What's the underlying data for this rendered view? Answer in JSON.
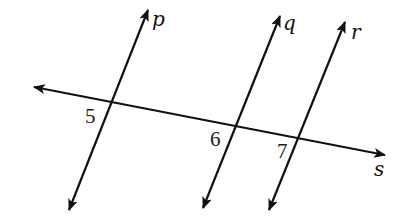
{
  "diagram": {
    "type": "geometry-parallel-lines-transversal",
    "colors": {
      "stroke": "#111111",
      "background": "#ffffff"
    },
    "lines": [
      {
        "id": "s",
        "label": "s",
        "role": "transversal",
        "x1": 34,
        "y1": 87,
        "x2": 385,
        "y2": 155,
        "label_x": 374,
        "label_y": 176
      },
      {
        "id": "p",
        "label": "p",
        "role": "parallel",
        "x1": 69,
        "y1": 210,
        "x2": 148,
        "y2": 10,
        "label_x": 152,
        "label_y": 26
      },
      {
        "id": "q",
        "label": "q",
        "role": "parallel",
        "x1": 203,
        "y1": 208,
        "x2": 280,
        "y2": 16,
        "label_x": 283,
        "label_y": 30
      },
      {
        "id": "r",
        "label": "r",
        "role": "parallel",
        "x1": 269,
        "y1": 210,
        "x2": 345,
        "y2": 22,
        "label_x": 351,
        "label_y": 39
      }
    ],
    "angles": [
      {
        "id": "angle-5",
        "label": "5",
        "at": "p∩s",
        "x": 85,
        "y": 123
      },
      {
        "id": "angle-6",
        "label": "6",
        "at": "q∩s",
        "x": 210,
        "y": 146
      },
      {
        "id": "angle-7",
        "label": "7",
        "at": "r∩s",
        "x": 277,
        "y": 158
      }
    ]
  }
}
